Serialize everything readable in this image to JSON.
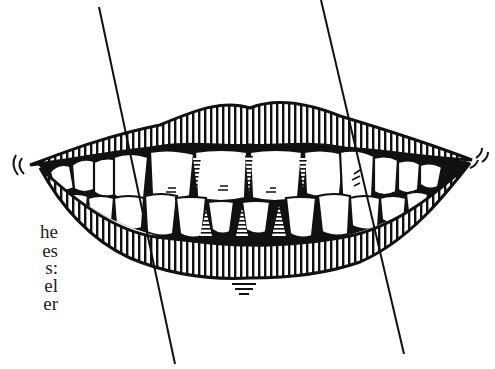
{
  "figure": {
    "ink_color": "#111111",
    "background": "#ffffff"
  },
  "text_fragments": [
    {
      "text": "he",
      "y": 222
    },
    {
      "text": "es",
      "y": 241
    },
    {
      "text": "s:",
      "y": 258
    },
    {
      "text": "el",
      "y": 276
    },
    {
      "text": "er",
      "y": 294
    }
  ],
  "guide_lines": [
    {
      "x1": 99,
      "y1": 7,
      "x2": 175,
      "y2": 364
    },
    {
      "x1": 321,
      "y1": 0,
      "x2": 404,
      "y2": 354
    }
  ]
}
